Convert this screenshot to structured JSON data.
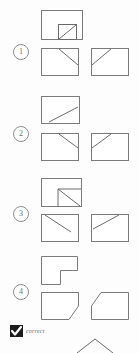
{
  "page": {
    "kind": "scanned-worksheet",
    "stroke_color": "#7a7a7a",
    "stroke_color_dark": "#5d5d5d",
    "background": "#fdfdfd",
    "ink_color": "#1c1c1c"
  },
  "items": [
    {
      "number": "1",
      "prompt": {
        "name": "rectangle-with-inner-square-diagonal",
        "label": "rectangle with small square at bottom right containing diagonal"
      },
      "options": [
        {
          "name": "rectangle-diagonal-top-left-to-right",
          "label": "rectangle with short diagonal from top-left toward right side"
        },
        {
          "name": "rectangle-diagonal-left-to-top-right",
          "label": "rectangle with short diagonal from left side up to top-right"
        }
      ]
    },
    {
      "number": "2",
      "prompt": {
        "name": "rectangle-diagonal-bottom-left-to-center-right",
        "label": "rectangle with diagonal from bottom-left to middle-right"
      },
      "options": [
        {
          "name": "rectangle-diagonal-top-left-to-right",
          "label": "rectangle with short diagonal from top-left toward right side"
        },
        {
          "name": "rectangle-diagonal-left-to-top-right",
          "label": "rectangle with short diagonal from left side up to top-right"
        }
      ]
    },
    {
      "number": "3",
      "prompt": {
        "name": "rectangle-with-notch-and-diagonal",
        "label": "rectangle with inner notch at right containing diagonal"
      },
      "options": [
        {
          "name": "rectangle-diagonal-top-left-to-right",
          "label": "rectangle with diagonal from top-left toward right side"
        },
        {
          "name": "rectangle-diagonal-left-to-top-right",
          "label": "rectangle with diagonal from left side up to top-right"
        }
      ]
    },
    {
      "number": "4",
      "prompt": {
        "name": "l-shaped-polygon",
        "label": "L-shaped polygon with notch cut from bottom-right"
      },
      "options": [
        {
          "name": "pentagon-chamfer-bottom-right",
          "label": "pentagon with chamfered bottom-right corner"
        },
        {
          "name": "pentagon-chamfer-top-left",
          "label": "pentagon with chamfered top-left corner"
        }
      ]
    }
  ],
  "annotation": {
    "checkbox_state": "checked",
    "text": "correct"
  },
  "footer_figure": {
    "name": "partial-peak-outline",
    "label": "partially visible peaked outline at bottom edge"
  }
}
